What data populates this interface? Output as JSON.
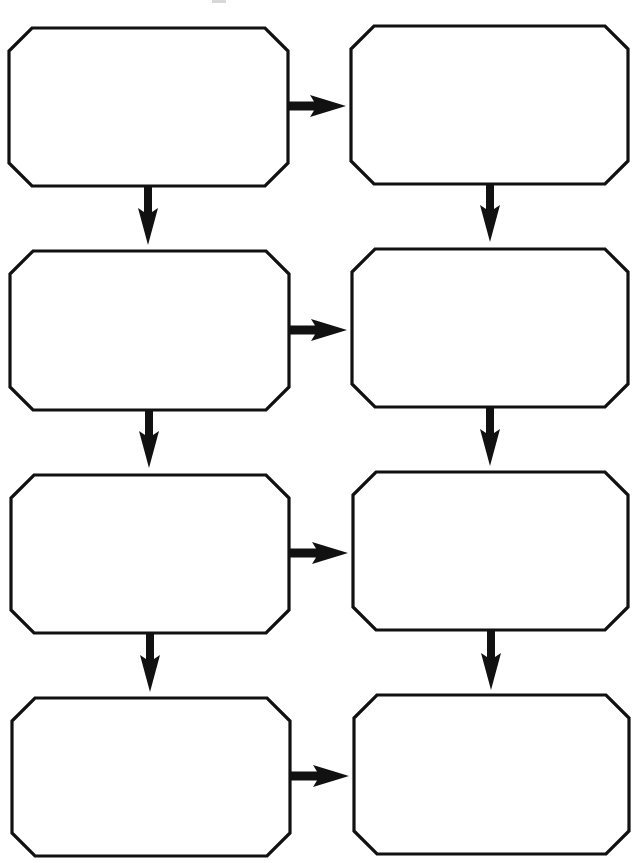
{
  "diagram": {
    "type": "flowchart-worksheet",
    "layout": "two-column grid, 4 rows, blank chamfered boxes",
    "colors": {
      "stroke": "#111111",
      "fill": "#ffffff",
      "background": "#ffffff"
    },
    "boxes": [
      {
        "id": "box-1",
        "row": 1,
        "col": 1,
        "x": 9,
        "y": 28,
        "w": 279,
        "h": 158,
        "label": ""
      },
      {
        "id": "box-2",
        "row": 1,
        "col": 2,
        "x": 351,
        "y": 26,
        "w": 277,
        "h": 158,
        "label": ""
      },
      {
        "id": "box-3",
        "row": 2,
        "col": 1,
        "x": 10,
        "y": 251,
        "w": 279,
        "h": 159,
        "label": ""
      },
      {
        "id": "box-4",
        "row": 2,
        "col": 2,
        "x": 352,
        "y": 249,
        "w": 276,
        "h": 158,
        "label": ""
      },
      {
        "id": "box-5",
        "row": 3,
        "col": 1,
        "x": 11,
        "y": 475,
        "w": 278,
        "h": 158,
        "label": ""
      },
      {
        "id": "box-6",
        "row": 3,
        "col": 2,
        "x": 353,
        "y": 472,
        "w": 275,
        "h": 158,
        "label": ""
      },
      {
        "id": "box-7",
        "row": 4,
        "col": 1,
        "x": 12,
        "y": 698,
        "w": 278,
        "h": 158,
        "label": ""
      },
      {
        "id": "box-8",
        "row": 4,
        "col": 2,
        "x": 354,
        "y": 695,
        "w": 275,
        "h": 159,
        "label": ""
      }
    ],
    "arrows": [
      {
        "from": "box-1",
        "to": "box-2",
        "dir": "right",
        "x1": 288,
        "y": 106,
        "x2": 346
      },
      {
        "from": "box-3",
        "to": "box-4",
        "dir": "right",
        "x1": 289,
        "y": 330,
        "x2": 347
      },
      {
        "from": "box-5",
        "to": "box-6",
        "dir": "right",
        "x1": 289,
        "y": 553,
        "x2": 348
      },
      {
        "from": "box-7",
        "to": "box-8",
        "dir": "right",
        "x1": 290,
        "y": 776,
        "x2": 349
      },
      {
        "from": "box-1",
        "to": "box-3",
        "dir": "down",
        "x": 148,
        "y1": 186,
        "y2": 245
      },
      {
        "from": "box-3",
        "to": "box-5",
        "dir": "down",
        "x": 149,
        "y1": 410,
        "y2": 468
      },
      {
        "from": "box-5",
        "to": "box-7",
        "dir": "down",
        "x": 150,
        "y1": 633,
        "y2": 692
      },
      {
        "from": "box-2",
        "to": "box-4",
        "dir": "down",
        "x": 490,
        "y1": 184,
        "y2": 242
      },
      {
        "from": "box-4",
        "to": "box-6",
        "dir": "down",
        "x": 490,
        "y1": 407,
        "y2": 466
      },
      {
        "from": "box-6",
        "to": "box-8",
        "dir": "down",
        "x": 491,
        "y1": 630,
        "y2": 690
      }
    ],
    "chamfer": 23
  }
}
